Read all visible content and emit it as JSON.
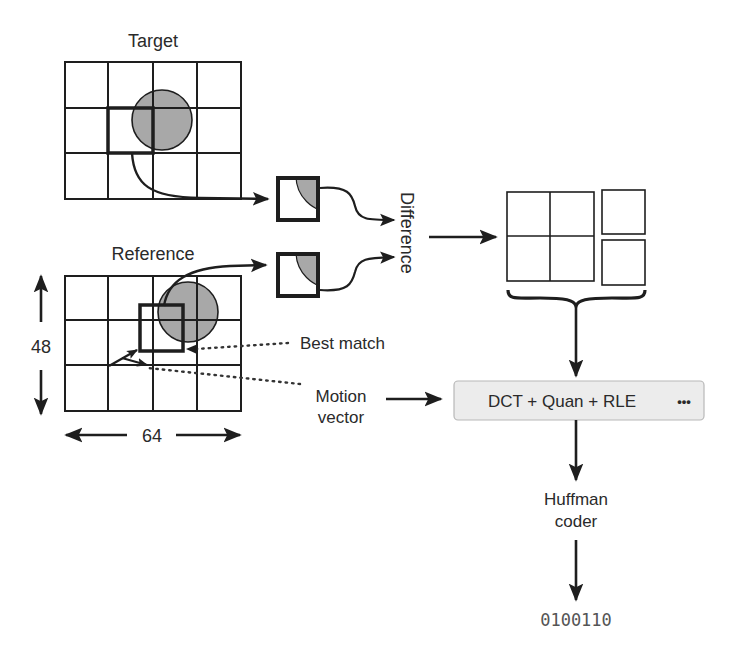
{
  "target": {
    "label": "Target",
    "grid": {
      "cols": 4,
      "rows": 3
    }
  },
  "reference": {
    "label": "Reference",
    "grid": {
      "cols": 4,
      "rows": 3
    },
    "height_label": "48",
    "width_label": "64"
  },
  "annotations": {
    "best_match": "Best match",
    "motion_vector_line1": "Motion",
    "motion_vector_line2": "vector"
  },
  "difference": {
    "label": "Difference"
  },
  "encoder": {
    "stage_label": "DCT + Quan + RLE",
    "more_label": "•••",
    "coder_line1": "Huffman",
    "coder_line2": "coder",
    "output_bits": "0100110"
  },
  "colors": {
    "stroke": "#1e1e1e",
    "circle_fill": "#a8a8a8",
    "box_fill": "#ececec",
    "box_stroke": "#b8b8b8",
    "dotted": "#333333"
  }
}
